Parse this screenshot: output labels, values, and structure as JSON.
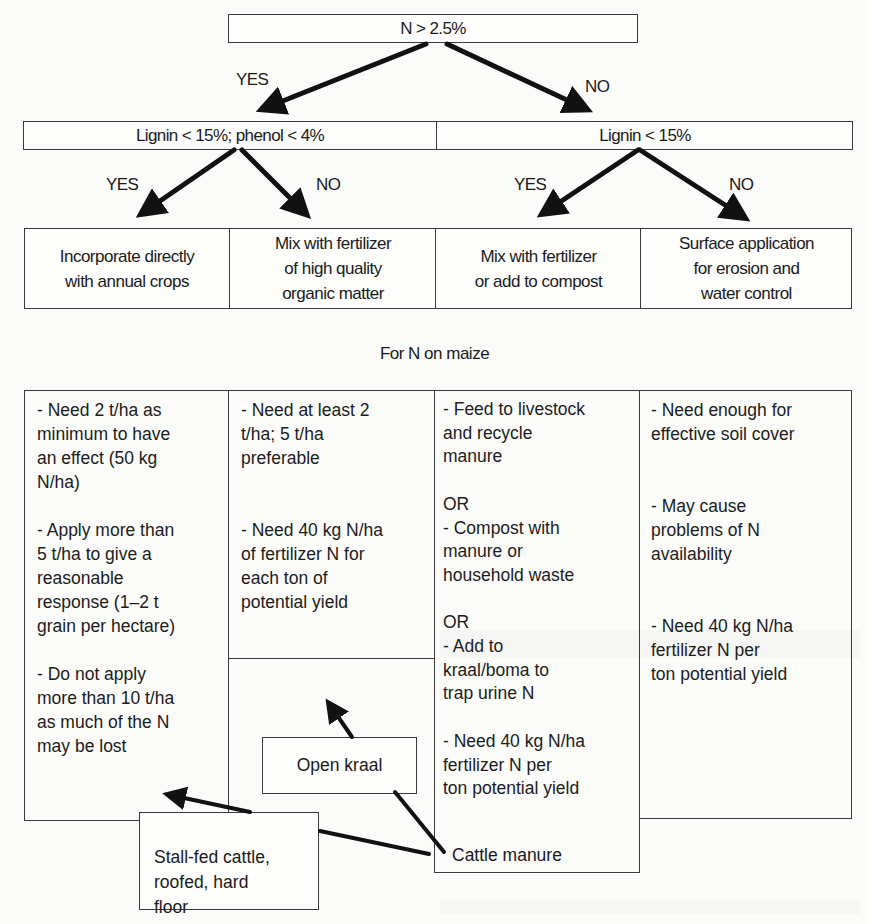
{
  "diagram": {
    "root": {
      "label": "N > 2.5%"
    },
    "branch_labels": {
      "yes": "YES",
      "no": "NO"
    },
    "level2": {
      "left": {
        "label": "Lignin < 15%; phenol < 4%"
      },
      "right": {
        "label": "Lignin < 15%"
      }
    },
    "actions": [
      {
        "label": "Incorporate directly\nwith annual crops"
      },
      {
        "label": "Mix with fertilizer\nof high quality\norganic matter"
      },
      {
        "label": "Mix with fertilizer\nor add to compost"
      },
      {
        "label": "Surface application\nfor erosion and\nwater control"
      }
    ],
    "section_title": "For N on maize",
    "details": [
      {
        "text": "- Need 2 t/ha as\nminimum to have\nan effect (50 kg\nN/ha)\n\n- Apply more than\n5 t/ha to give a\nreasonable\nresponse (1–2 t\ngrain per hectare)\n\n- Do not apply\nmore than 10 t/ha\nas much of the N\nmay be lost"
      },
      {
        "text": "- Need at least 2\nt/ha; 5 t/ha\npreferable\n\n\n- Need 40 kg N/ha\nof fertilizer N for\neach ton of\npotential yield"
      },
      {
        "text": "- Feed to livestock\nand recycle\nmanure\n\nOR\n- Compost with\nmanure or\nhousehold waste\n\nOR\n- Add to\nkraal/boma to\ntrap urine N\n\n- Need 40 kg N/ha\nfertilizer N per\nton potential yield"
      },
      {
        "text": "- Need enough for\neffective soil cover\n\n\n- May cause\nproblems of N\navailability\n\n\n- Need 40 kg N/ha\nfertilizer N per\nton potential yield"
      }
    ],
    "manure_flow": {
      "source": "Cattle manure",
      "options": [
        {
          "label": "Open kraal"
        },
        {
          "label": "Stall-fed cattle,\nroofed, hard\nfloor"
        }
      ]
    }
  },
  "colors": {
    "background": "#fbfbfa",
    "line": "#3a3a3a",
    "arrow": "#111111",
    "text": "#1a1a1a"
  }
}
